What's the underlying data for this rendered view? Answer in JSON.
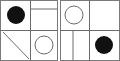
{
  "figure": {
    "type": "geometric-matrix",
    "background_color": "#ffffff",
    "line_color": "#6b6b6b",
    "border_color": "#7a7a7a",
    "fill_color": "#111111",
    "panel_count": 2,
    "grid": {
      "rows": 2,
      "cols": 2
    }
  },
  "panels": [
    {
      "name": "left-panel",
      "label": "Left panel",
      "x": 0,
      "y": 0,
      "width": 58,
      "height": 61,
      "divider_x": 30,
      "divider_y": 30,
      "cells": [
        {
          "name": "top-left",
          "label": "Top-left cell",
          "content": "filled-circle",
          "shape": "circle",
          "fill": "solid",
          "color": "#111111",
          "cx": 16,
          "cy": 15,
          "r": 9
        },
        {
          "name": "top-right",
          "label": "Top-right cell",
          "content": "horizontal-line",
          "shape": "line",
          "orientation": "horizontal",
          "x1": 31,
          "y1": 9,
          "x2": 57,
          "y2": 9
        },
        {
          "name": "bottom-left",
          "label": "Bottom-left cell",
          "content": "diagonal-line",
          "shape": "line",
          "orientation": "diagonal",
          "x1": 3,
          "y1": 32,
          "x2": 29,
          "y2": 59
        },
        {
          "name": "bottom-right",
          "label": "Bottom-right cell",
          "content": "outline-circle",
          "shape": "circle",
          "fill": "none",
          "color": "#6b6b6b",
          "cx": 44,
          "cy": 45,
          "r": 9
        }
      ]
    },
    {
      "name": "right-panel",
      "label": "Right panel",
      "x": 60,
      "y": 0,
      "width": 60,
      "height": 61,
      "divider_x": 29,
      "divider_y": 30,
      "cells": [
        {
          "name": "top-left",
          "label": "Top-left cell",
          "content": "outline-circle",
          "shape": "circle",
          "fill": "none",
          "color": "#6b6b6b",
          "cx": 14,
          "cy": 15,
          "r": 9
        },
        {
          "name": "top-right",
          "label": "Top-right cell",
          "content": "empty",
          "shape": "none"
        },
        {
          "name": "bottom-left",
          "label": "Bottom-left cell",
          "content": "vertical-line",
          "shape": "line",
          "orientation": "vertical",
          "x1": 13,
          "y1": 31,
          "x2": 13,
          "y2": 60
        },
        {
          "name": "bottom-right",
          "label": "Bottom-right cell",
          "content": "filled-circle",
          "shape": "circle",
          "fill": "solid",
          "color": "#111111",
          "cx": 44,
          "cy": 45,
          "r": 9
        }
      ]
    }
  ]
}
